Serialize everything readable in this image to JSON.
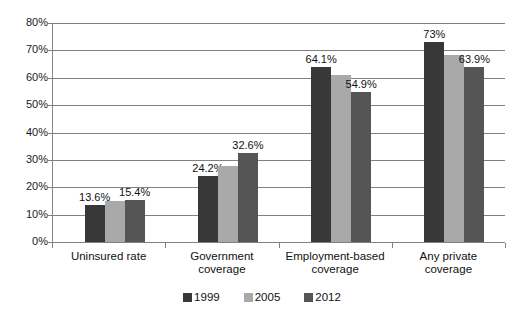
{
  "chart_data": {
    "type": "bar",
    "title": "",
    "subtitle": "",
    "xlabel": "",
    "ylabel": "",
    "ylim": [
      0,
      80
    ],
    "grid": true,
    "legend_position": "bottom",
    "categories": [
      "Uninsured rate",
      "Government coverage",
      "Employment-based coverage",
      "Any private coverage"
    ],
    "category_lines": [
      [
        "Uninsured rate"
      ],
      [
        "Government",
        "coverage"
      ],
      [
        "Employment-based",
        "coverage"
      ],
      [
        "Any private",
        "coverage"
      ]
    ],
    "series": [
      {
        "name": "1999",
        "color": "#383838",
        "values": [
          13.6,
          24.2,
          64.1,
          73.0
        ],
        "labels": [
          "13.6%",
          "24.2%",
          "64.1%",
          "73%"
        ]
      },
      {
        "name": "2005",
        "color": "#a9a9a9",
        "values": [
          14.9,
          27.9,
          60.9,
          68.3
        ],
        "labels": [
          "",
          "",
          "",
          ""
        ]
      },
      {
        "name": "2012",
        "color": "#555555",
        "values": [
          15.4,
          32.6,
          54.9,
          63.9
        ],
        "labels": [
          "15.4%",
          "32.6%",
          "54.9%",
          "63.9%"
        ]
      }
    ],
    "y_ticks": [
      "0%",
      "10%",
      "20%",
      "30%",
      "40%",
      "50%",
      "60%",
      "70%",
      "80%"
    ],
    "y_tick_values": [
      0,
      10,
      20,
      30,
      40,
      50,
      60,
      70,
      80
    ]
  },
  "legend": {
    "items": [
      {
        "label": "1999",
        "color": "#383838"
      },
      {
        "label": "2005",
        "color": "#a9a9a9"
      },
      {
        "label": "2012",
        "color": "#555555"
      }
    ]
  }
}
